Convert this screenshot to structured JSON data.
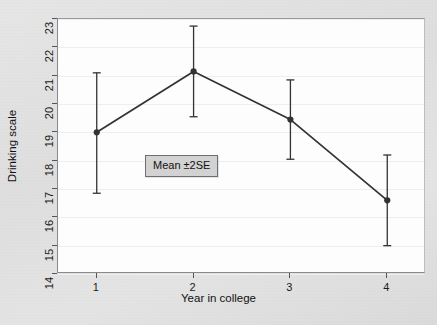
{
  "chart_data": {
    "type": "line",
    "title": "",
    "xlabel": "Year in college",
    "ylabel": "Drinking scale",
    "xlim": [
      0.6,
      4.4
    ],
    "ylim": [
      14,
      23
    ],
    "xticks": [
      1,
      2,
      3,
      4
    ],
    "xticklabels": [
      "1",
      "2",
      "3",
      "4"
    ],
    "yticks": [
      14,
      15,
      16,
      17,
      18,
      19,
      20,
      21,
      22,
      23
    ],
    "yticklabels": [
      "14",
      "15",
      "16",
      "17",
      "18",
      "19",
      "20",
      "21",
      "22",
      "23"
    ],
    "grid": "horizontal",
    "legend_position": "inside-center-left",
    "legend_entries": [
      "Mean ±2SE"
    ],
    "series": [
      {
        "name": "Mean ±2SE",
        "x": [
          1,
          2,
          3,
          4
        ],
        "values": [
          19.0,
          21.15,
          19.45,
          16.6
        ],
        "error_low": [
          16.85,
          19.55,
          18.05,
          15.0
        ],
        "error_high": [
          21.1,
          22.75,
          20.85,
          18.2
        ],
        "marker": "filled-circle",
        "color": "#333333"
      }
    ]
  },
  "legend": {
    "label": "Mean ±2SE"
  },
  "axes": {
    "x_title": "Year in college",
    "y_title": "Drinking scale"
  },
  "colors": {
    "page_background": "#e3e3e3",
    "plot_background": "#fdfdfd",
    "series": "#333333",
    "gridline": "#eceff1",
    "frame": "#8a8a8a",
    "legend_background": "#d2d2d2"
  }
}
